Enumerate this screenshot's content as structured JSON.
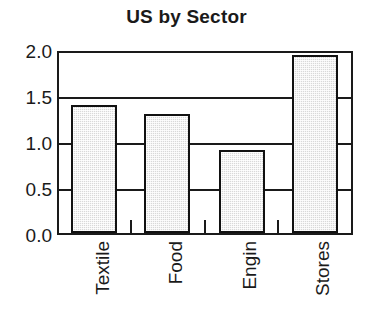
{
  "chart_data": {
    "type": "bar",
    "title": "US by Sector",
    "xlabel": "",
    "ylabel": "",
    "categories": [
      "Textile",
      "Food",
      "Engin",
      "Stores"
    ],
    "values": [
      1.4,
      1.3,
      0.9,
      1.95
    ],
    "ylim": [
      0.0,
      2.0
    ],
    "yticks": [
      0.0,
      0.5,
      1.0,
      1.5,
      2.0
    ],
    "ytick_labels": [
      "0.0",
      "0.5",
      "1.0",
      "1.5",
      "2.0"
    ],
    "grid": true,
    "grid_axis": "y",
    "legend": false,
    "legend_position": "none",
    "bar_fill_color": "#d9d9d9",
    "bar_edge_color": "#111111",
    "axis_color": "#1a1a1a",
    "background_color": "#ffffff",
    "xtick_label_rotation": 90
  },
  "axis": {
    "y_labels": [
      {
        "text": "2.0",
        "top": 42
      },
      {
        "text": "1.5",
        "top": 88
      },
      {
        "text": "1.0",
        "top": 134
      },
      {
        "text": "0.5",
        "top": 180
      },
      {
        "text": "0.0",
        "top": 226
      }
    ]
  },
  "bars": [
    {
      "name": "Textile",
      "left": 12,
      "width": 46,
      "value": 1.4
    },
    {
      "name": "Food",
      "left": 85,
      "width": 46,
      "value": 1.3
    },
    {
      "name": "Engin",
      "left": 160,
      "width": 46,
      "value": 0.9
    },
    {
      "name": "Stores",
      "left": 233,
      "width": 46,
      "value": 1.95
    }
  ],
  "x_ticks": [
    {
      "left": 71
    },
    {
      "left": 145
    },
    {
      "left": 218
    }
  ],
  "x_labels": [
    {
      "text": "Textile",
      "left": 93
    },
    {
      "text": "Food",
      "left": 166
    },
    {
      "text": "Engin",
      "left": 240
    },
    {
      "text": "Stores",
      "left": 313
    }
  ]
}
